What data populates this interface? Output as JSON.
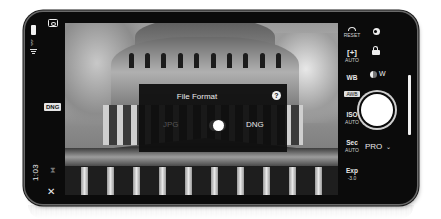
{
  "status_bar": {
    "time": "1:03",
    "icons": [
      "battery-icon",
      "bluetooth-icon",
      "wifi-icon"
    ]
  },
  "left_rail": {
    "camera_switch_icon": "camera-switch-icon",
    "format_badge": "DNG",
    "timer_icon": "⧗",
    "close_icon": "✕"
  },
  "dialog": {
    "title": "File Format",
    "help_icon": "?",
    "option_left": "JPG",
    "option_right": "DNG",
    "selected": "DNG"
  },
  "right_panel": {
    "reset": {
      "label": "RESET"
    },
    "exposure_lock": {
      "icon": "[+]",
      "label": "AUTO"
    },
    "wb": {
      "label": "WB",
      "value": "AWB"
    },
    "iso": {
      "label": "ISO",
      "value": "AUTO"
    },
    "shutter_speed": {
      "label": "Sec",
      "value": "AUTO"
    },
    "exposure": {
      "label": "Exp",
      "value": "-3.0"
    },
    "lens": {
      "label": "W"
    },
    "mode": {
      "label": "PRO",
      "chevron": "⌄"
    }
  }
}
